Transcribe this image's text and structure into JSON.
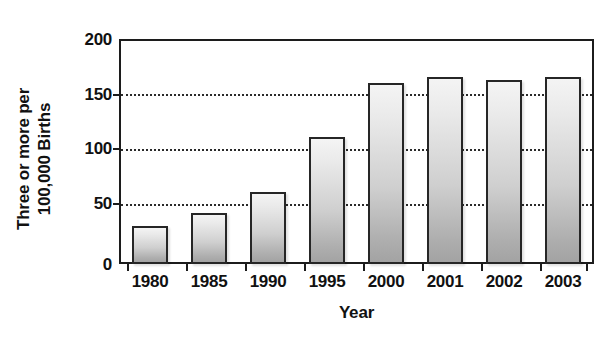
{
  "chart_data": {
    "type": "bar",
    "title": "",
    "xlabel": "Year",
    "ylabel_line1": "Three or more per",
    "ylabel_line2": "100,000 Births",
    "categories": [
      "1980",
      "1985",
      "1990",
      "1995",
      "2000",
      "2001",
      "2002",
      "2003"
    ],
    "values": [
      34,
      45,
      64,
      113,
      161,
      166,
      164,
      166
    ],
    "ylim": [
      0,
      200
    ],
    "yticks": [
      0,
      50,
      100,
      150,
      200
    ],
    "ytick_labels": [
      "0",
      "50",
      "100",
      "150",
      "200"
    ],
    "grid": "horizontal-dotted",
    "legend": "none",
    "bar_fill_top": "#f4f4f4",
    "bar_fill_bottom": "#a3a3a3",
    "bar_border": "#262626",
    "axis_color": "#1c1c1c",
    "background": "#ffffff"
  }
}
